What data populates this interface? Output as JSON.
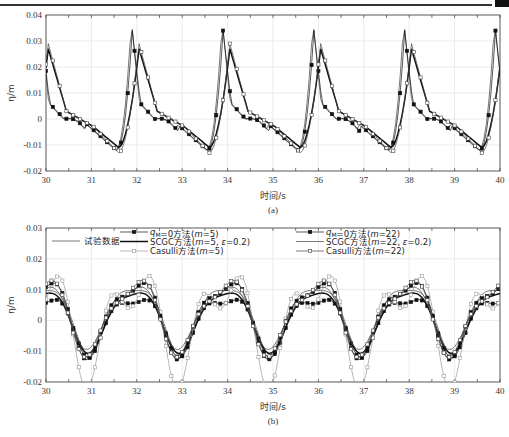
{
  "header": {
    "rule": true
  },
  "chart_data": [
    {
      "id": "a",
      "type": "line",
      "caption": "(a)",
      "xlabel": "时间/s",
      "ylabel": "η/m",
      "xlim": [
        30,
        40
      ],
      "ylim": [
        -0.02,
        0.04
      ],
      "xticks": [
        30,
        31,
        32,
        33,
        34,
        35,
        36,
        37,
        38,
        39,
        40
      ],
      "yticks": [
        -0.02,
        -0.01,
        0,
        0.01,
        0.02,
        0.03,
        0.04
      ],
      "ytick_labels": [
        "-0.02",
        "-0.01",
        "0",
        "0.01",
        "0.02",
        "0.03",
        "0.04"
      ],
      "grid": true,
      "period": 2.0,
      "series": [
        {
          "name": "试验数据",
          "style": "solid-thin",
          "peak_t": 31.88,
          "peak": 0.038,
          "trough": -0.012,
          "shape": "sharp"
        },
        {
          "name": "q_M=0方法(m=5)",
          "style": "filled-square",
          "peak_t": 31.9,
          "peak": 0.034,
          "trough": -0.012,
          "shape": "sharp"
        },
        {
          "name": "SCGC方法(m=5, ε=0.2)",
          "style": "solid-thick",
          "peak_t": 32.05,
          "peak": 0.027,
          "trough": -0.011,
          "shape": "smooth"
        },
        {
          "name": "Casulli方法(m=5)",
          "style": "open-square",
          "peak_t": 32.05,
          "peak": 0.029,
          "trough": -0.013,
          "shape": "smooth"
        }
      ]
    },
    {
      "id": "b",
      "type": "line",
      "caption": "(b)",
      "xlabel": "时间/s",
      "ylabel": "η/m",
      "xlim": [
        30,
        40
      ],
      "ylim": [
        -0.02,
        0.03
      ],
      "xticks": [
        30,
        31,
        32,
        33,
        34,
        35,
        36,
        37,
        38,
        39,
        40
      ],
      "yticks": [
        -0.02,
        -0.01,
        0,
        0.01,
        0.02,
        0.03
      ],
      "ytick_labels": [
        "-0.02",
        "-0.01",
        "0",
        "0.01",
        "0.02",
        "0.03"
      ],
      "grid": true,
      "legend": {
        "col1": [
          {
            "label": "试验数据",
            "style": "solid-thin"
          }
        ],
        "col2": [
          {
            "label": "q_M=0方法(m=5)",
            "style": "filled-square"
          },
          {
            "label": "SCGC方法(m=5, ε=0.2)",
            "style": "solid-thick"
          },
          {
            "label": "Casulli方法(m=5)",
            "style": "open-square-thin"
          }
        ],
        "col3": [
          {
            "label": "q_M=0方法(m=22)",
            "style": "filled-square"
          },
          {
            "label": "SCGC方法(m=22, ε=0.2)",
            "style": "solid-thin"
          },
          {
            "label": "Casulli方法(m=22)",
            "style": "open-square"
          }
        ]
      },
      "series": [
        {
          "name": "试验数据",
          "amp": 0.013,
          "offset": 0.002
        },
        {
          "name": "q_M=0方法(m=5)",
          "amp": 0.011,
          "offset": 0.0
        },
        {
          "name": "SCGC方法(m=5, ε=0.2)",
          "amp": 0.012,
          "offset": 0.001
        },
        {
          "name": "Casulli方法(m=5)",
          "amp": 0.017,
          "offset": 0.0
        },
        {
          "name": "q_M=0方法(m=22)",
          "amp": 0.014,
          "offset": 0.002
        },
        {
          "name": "SCGC方法(m=22, ε=0.2)",
          "amp": 0.012,
          "offset": 0.002
        },
        {
          "name": "Casulli方法(m=22)",
          "amp": 0.014,
          "offset": 0.002
        }
      ]
    }
  ],
  "labels": {
    "legend_b_col1_0": "试验数据",
    "qm": "q",
    "qm_sub": "M",
    "leg_b": [
      [
        "=0方法(",
        "m",
        "=5)"
      ],
      [
        "SCGC方法(",
        "m",
        "=5, ",
        "ε",
        "=0.2)"
      ],
      [
        "Casulli方法(",
        "m",
        "=5)"
      ],
      [
        "=0方法(",
        "m",
        "=22)"
      ],
      [
        "SCGC方法(",
        "m",
        "=22, ",
        "ε",
        "=0.2)"
      ],
      [
        "Casulli方法(",
        "m",
        "=22)"
      ]
    ]
  }
}
